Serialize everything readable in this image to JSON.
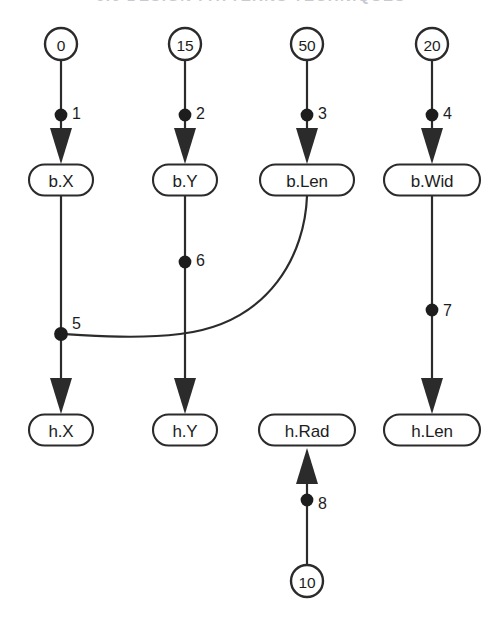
{
  "figure": {
    "title_strip": "6.6    DESIGN  PATTERNS  TECHNIQUES",
    "background_color": "#ffffff",
    "ink_color": "#2b2b2b"
  },
  "diagram": {
    "type": "dependency-dataflow-graph",
    "constant_nodes": [
      {
        "id": "c0",
        "label": "0",
        "cx": 61,
        "cy": 44,
        "r": 16
      },
      {
        "id": "c15",
        "label": "15",
        "cx": 185,
        "cy": 44,
        "r": 16
      },
      {
        "id": "c50",
        "label": "50",
        "cx": 307,
        "cy": 44,
        "r": 16
      },
      {
        "id": "c20",
        "label": "20",
        "cx": 432,
        "cy": 44,
        "r": 16
      },
      {
        "id": "c10",
        "label": "10",
        "cx": 307,
        "cy": 581,
        "r": 16
      }
    ],
    "variable_nodes": [
      {
        "id": "bX",
        "label": "b.X",
        "cx": 61,
        "cy": 180,
        "w": 64,
        "h": 31
      },
      {
        "id": "bY",
        "label": "b.Y",
        "cx": 185,
        "cy": 180,
        "w": 64,
        "h": 31
      },
      {
        "id": "bLen",
        "label": "b.Len",
        "cx": 307,
        "cy": 180,
        "w": 94,
        "h": 31
      },
      {
        "id": "bWid",
        "label": "b.Wid",
        "cx": 432,
        "cy": 180,
        "w": 96,
        "h": 31
      },
      {
        "id": "hX",
        "label": "h.X",
        "cx": 61,
        "cy": 430,
        "w": 64,
        "h": 31
      },
      {
        "id": "hY",
        "label": "h.Y",
        "cx": 185,
        "cy": 430,
        "w": 64,
        "h": 31
      },
      {
        "id": "hRad",
        "label": "h.Rad",
        "cx": 307,
        "cy": 430,
        "w": 96,
        "h": 31
      },
      {
        "id": "hLen",
        "label": "h.Len",
        "cx": 432,
        "cy": 430,
        "w": 96,
        "h": 31
      }
    ],
    "edges": [
      {
        "id": "e1",
        "label": "1",
        "from": "c0",
        "to": "bX",
        "dot_x": 61,
        "dot_y": 115,
        "label_x": 72,
        "label_y": 113,
        "direction": "down"
      },
      {
        "id": "e2",
        "label": "2",
        "from": "c15",
        "to": "bY",
        "dot_x": 185,
        "dot_y": 115,
        "label_x": 196,
        "label_y": 113,
        "direction": "down"
      },
      {
        "id": "e3",
        "label": "3",
        "from": "c50",
        "to": "bLen",
        "dot_x": 307,
        "dot_y": 115,
        "label_x": 318,
        "label_y": 113,
        "direction": "down"
      },
      {
        "id": "e4",
        "label": "4",
        "from": "c20",
        "to": "bWid",
        "dot_x": 432,
        "dot_y": 115,
        "label_x": 443,
        "label_y": 113,
        "direction": "down"
      },
      {
        "id": "e5",
        "label": "5",
        "from": "bX",
        "to": "hX",
        "dot_x": 61,
        "dot_y": 334,
        "label_x": 72,
        "label_y": 323,
        "direction": "down"
      },
      {
        "id": "e6",
        "label": "6",
        "from": "bY",
        "to": "hY",
        "dot_x": 185,
        "dot_y": 262,
        "label_x": 196,
        "label_y": 260,
        "direction": "down"
      },
      {
        "id": "e7",
        "label": "7",
        "from": "bWid",
        "to": "hLen",
        "dot_x": 432,
        "dot_y": 310,
        "label_x": 443,
        "label_y": 310,
        "direction": "down"
      },
      {
        "id": "e8",
        "label": "8",
        "from": "c10",
        "to": "hRad",
        "dot_x": 307,
        "dot_y": 500,
        "label_x": 318,
        "label_y": 503,
        "direction": "up"
      }
    ],
    "curved_edge": {
      "id": "e-curve",
      "from": "bLen",
      "to_dot": "e5",
      "path": "M 307 196 C 305 250, 270 322, 180 334 C 140 339, 95 336, 64 334"
    }
  }
}
